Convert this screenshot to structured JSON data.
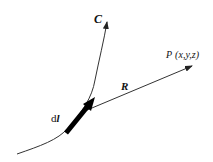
{
  "diagram": {
    "title": "",
    "curve": {
      "label": "C",
      "color": "#222222"
    },
    "element": {
      "label_prefix": "d",
      "label_var": "l",
      "color": "#000000"
    },
    "vector": {
      "label": "R",
      "color": "#222222"
    },
    "point": {
      "label_name": "P",
      "label_coords": "(x,y,z)"
    }
  }
}
